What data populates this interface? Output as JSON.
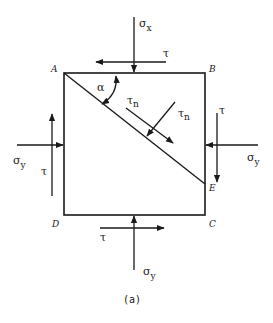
{
  "figure": {
    "caption": "(a)"
  },
  "corners": {
    "A": "A",
    "B": "B",
    "C": "C",
    "D": "D",
    "E": "E"
  },
  "labels": {
    "sigma": "σ",
    "tau": "τ",
    "alpha": "α",
    "sub_x": "x",
    "sub_y": "y",
    "sub_n": "n"
  },
  "stresses": [
    {
      "id": "top-normal",
      "symbol": "σ",
      "subscript": "x",
      "direction": "down"
    },
    {
      "id": "top-shear",
      "symbol": "τ",
      "subscript": "",
      "direction": "left"
    },
    {
      "id": "left-normal",
      "symbol": "σ",
      "subscript": "y",
      "direction": "right"
    },
    {
      "id": "left-shear",
      "symbol": "τ",
      "subscript": "",
      "direction": "up"
    },
    {
      "id": "right-normal",
      "symbol": "σ",
      "subscript": "y",
      "direction": "left"
    },
    {
      "id": "right-shear",
      "symbol": "τ",
      "subscript": "",
      "direction": "down"
    },
    {
      "id": "bottom-normal",
      "symbol": "σ",
      "subscript": "y",
      "direction": "up"
    },
    {
      "id": "bottom-shear",
      "symbol": "τ",
      "subscript": "",
      "direction": "right"
    },
    {
      "id": "inclined-shear-1",
      "symbol": "τ",
      "subscript": "n",
      "direction": "along-plane"
    },
    {
      "id": "inclined-shear-2",
      "symbol": "τ",
      "subscript": "n",
      "direction": "toward-plane"
    }
  ],
  "colors": {
    "stroke": "#1a1a1a",
    "background": "#ffffff"
  }
}
